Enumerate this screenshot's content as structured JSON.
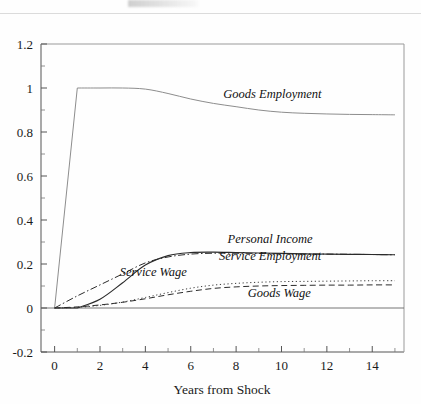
{
  "figure": {
    "background_color": "#fefefe",
    "axis_color": "#555555",
    "frame_color": "#9a9a9a"
  },
  "axis": {
    "xlabel": "Years from Shock",
    "ylabel": "",
    "x_ticks": [
      "0",
      "2",
      "4",
      "6",
      "8",
      "10",
      "12",
      "14"
    ],
    "y_ticks": [
      "-0.2",
      "0",
      "0.2",
      "0.4",
      "0.6",
      "0.8",
      "1",
      "1.2"
    ]
  },
  "labels": {
    "goods_employment": "Goods Employment",
    "personal_income": "Personal Income",
    "service_employment": "Service Employment",
    "service_wage": "Service Wage",
    "goods_wage": "Goods Wage"
  },
  "chart_data": {
    "type": "line",
    "title": "",
    "xlabel": "Years from Shock",
    "ylabel": "",
    "xlim": [
      -0.6,
      15.4
    ],
    "ylim": [
      -0.2,
      1.2
    ],
    "xticks": [
      0,
      2,
      4,
      6,
      8,
      10,
      12,
      14
    ],
    "yticks": [
      -0.2,
      0,
      0.2,
      0.4,
      0.6,
      0.8,
      1,
      1.2
    ],
    "grid": false,
    "legend": "inline-annotations",
    "x": [
      0,
      1,
      2,
      3,
      4,
      5,
      6,
      7,
      8,
      9,
      10,
      11,
      12,
      13,
      14,
      15
    ],
    "series": [
      {
        "name": "Goods Employment",
        "style": "solid",
        "color": "#8d8d8d",
        "width": 1.0,
        "label_x": 9.6,
        "label_y": 0.955,
        "values": [
          0.0,
          1.0,
          1.0,
          1.0,
          0.995,
          0.975,
          0.95,
          0.93,
          0.915,
          0.9,
          0.89,
          0.885,
          0.882,
          0.88,
          0.879,
          0.878
        ]
      },
      {
        "name": "Personal Income",
        "style": "solid",
        "color": "#2b2b2b",
        "width": 1.15,
        "label_x": 9.5,
        "label_y": 0.295,
        "values": [
          0.0,
          0.0,
          0.04,
          0.115,
          0.195,
          0.238,
          0.252,
          0.254,
          0.252,
          0.25,
          0.248,
          0.246,
          0.245,
          0.244,
          0.243,
          0.242
        ]
      },
      {
        "name": "Service Employment",
        "style": "dashdot",
        "color": "#2b2b2b",
        "width": 1.0,
        "label_x": 9.5,
        "label_y": 0.218,
        "values": [
          0.0,
          0.055,
          0.105,
          0.155,
          0.205,
          0.232,
          0.245,
          0.249,
          0.249,
          0.248,
          0.247,
          0.246,
          0.245,
          0.244,
          0.243,
          0.242
        ]
      },
      {
        "name": "Service Wage",
        "style": "dotted",
        "color": "#3a3a3a",
        "width": 1.0,
        "label_x": 4.35,
        "label_y": 0.147,
        "values": [
          0.0,
          0.003,
          0.012,
          0.027,
          0.048,
          0.07,
          0.09,
          0.104,
          0.112,
          0.117,
          0.12,
          0.121,
          0.122,
          0.123,
          0.124,
          0.124
        ]
      },
      {
        "name": "Goods Wage",
        "style": "dashed",
        "color": "#2b2b2b",
        "width": 1.0,
        "label_x": 9.9,
        "label_y": 0.052,
        "values": [
          0.0,
          0.005,
          0.014,
          0.026,
          0.042,
          0.06,
          0.076,
          0.089,
          0.096,
          0.1,
          0.102,
          0.103,
          0.104,
          0.104,
          0.105,
          0.105
        ]
      }
    ]
  }
}
